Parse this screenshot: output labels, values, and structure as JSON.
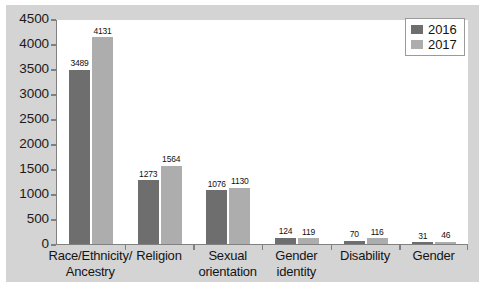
{
  "chart_data": {
    "type": "bar",
    "title": "",
    "xlabel": "",
    "ylabel": "",
    "ylim": [
      0,
      4500
    ],
    "yticks": [
      0,
      500,
      1000,
      1500,
      2000,
      2500,
      3000,
      3500,
      4000,
      4500
    ],
    "ytick_labels": [
      "0",
      "500",
      "1000",
      "1500",
      "2000",
      "2500",
      "3000",
      "3500",
      "4000",
      "4500"
    ],
    "grid": false,
    "legend_position": "top-right",
    "categories": [
      "Race/Ethnicity/\nAncestry",
      "Religion",
      "Sexual\norientation",
      "Gender\nidentity",
      "Disability",
      "Gender"
    ],
    "series": [
      {
        "name": "2016",
        "color": "#6e6e6e",
        "values": [
          3489,
          1273,
          1076,
          124,
          70,
          31
        ],
        "labels": [
          "3489",
          "1273",
          "1076",
          "124",
          "70",
          "31"
        ]
      },
      {
        "name": "2017",
        "color": "#adadad",
        "values": [
          4131,
          1564,
          1130,
          119,
          116,
          46
        ],
        "labels": [
          "4131",
          "1564",
          "1130",
          "119",
          "116",
          "46"
        ]
      }
    ]
  },
  "legend": {
    "items": [
      {
        "label": "2016",
        "color": "#6e6e6e"
      },
      {
        "label": "2017",
        "color": "#adadad"
      }
    ]
  },
  "caption": {
    "text": ""
  },
  "colors": {
    "panel_background": "#d4d4d4",
    "plot_background": "#ffffff",
    "axis": "#808080",
    "text": "#141414"
  }
}
